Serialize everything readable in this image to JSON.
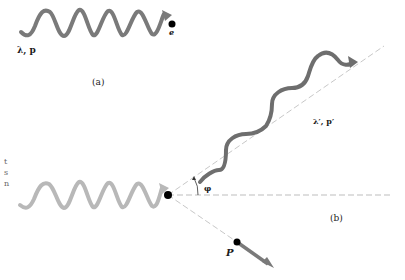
{
  "figure": {
    "panel_a": {
      "caption": "(a)",
      "photon_label": "λ, p",
      "electron_label": "e",
      "wave_color": "#7a7a7a"
    },
    "panel_b": {
      "caption": "(b)",
      "incident_wave_color": "#b8b8b8",
      "scattered_wave_color": "#6e6e6e",
      "scattered_photon_label": "λ′, p′",
      "angle_label": "φ",
      "recoil_electron_label": "P",
      "dashed_line_color": "#bdbdbd"
    },
    "left_edge_fragments": [
      "t",
      "s",
      "n"
    ]
  }
}
